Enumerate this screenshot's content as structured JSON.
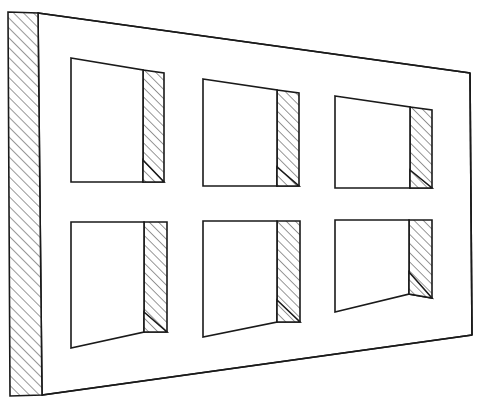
{
  "drawing": {
    "title": "Perspective line drawing of a wall with six rectangular window openings",
    "subject": "wall-elevation-perspective",
    "style": "technical line drawing, ink on white",
    "canvas": {
      "width": 479,
      "height": 406,
      "background": "#ffffff"
    },
    "stroke_color": "#1a1a1a",
    "hatch_color": "#1a1a1a",
    "fill_color": "#ffffff",
    "vanishing_direction": "right",
    "notes": "Left edge shows hatched cut section of the wall; each opening shows a hatched right-hand reveal (jamb) with a small triangular sill at its base."
  },
  "wall": {
    "name": "wall-face",
    "outline_points": "38,13 470,73 472,335 42,395",
    "section_strip": {
      "name": "wall-section-strip",
      "points": "8,12 38,13 42,395 10,396",
      "hatch_angle_deg": -45
    },
    "top_edge": "38,13 470,73",
    "bottom_edge": "42,395 472,335",
    "right_edge": "470,73 472,335"
  },
  "openings": [
    {
      "id": "opening-top-left",
      "row": "top",
      "column": 1,
      "void_points": "71,58 143,70 143,182 71,182",
      "reveal_points": "143,70 164,73 164,182 143,182",
      "sill_points": "143,160 164,182 143,182",
      "hatched": true
    },
    {
      "id": "opening-top-center",
      "row": "top",
      "column": 2,
      "void_points": "203,79 277,90 277,186 203,186",
      "reveal_points": "277,90 299,93 299,186 277,186",
      "sill_points": "277,167 299,186 277,186",
      "hatched": true
    },
    {
      "id": "opening-top-right",
      "row": "top",
      "column": 3,
      "void_points": "335,96 410,107 410,188 335,188",
      "reveal_points": "410,107 432,110 432,188 410,188",
      "sill_points": "410,170 432,188 410,188",
      "hatched": true
    },
    {
      "id": "opening-bottom-left",
      "row": "bottom",
      "column": 1,
      "void_points": "71,222 144,222 144,332 71,348",
      "reveal_points": "144,222 167,222 167,332 144,332",
      "sill_points": "144,312 167,332 144,332",
      "hatched": true
    },
    {
      "id": "opening-bottom-center",
      "row": "bottom",
      "column": 2,
      "void_points": "203,221 277,221 277,322 203,337",
      "reveal_points": "277,221 300,221 300,322 277,322",
      "sill_points": "277,300 300,322 277,322",
      "hatched": true
    },
    {
      "id": "opening-bottom-right",
      "row": "bottom",
      "column": 3,
      "void_points": "335,220 409,220 409,294 335,312",
      "reveal_points": "409,220 432,220 432,298 409,294",
      "sill_points": "409,272 432,298 409,294",
      "hatched": true
    }
  ]
}
